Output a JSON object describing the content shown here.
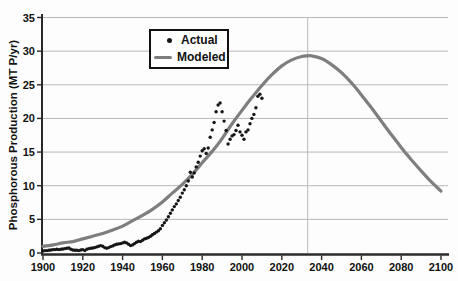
{
  "chart_data": {
    "type": "line",
    "title": "",
    "xlabel": "",
    "ylabel": "Phosphorous Production (MT P/yr)",
    "xlim": [
      1900,
      2100
    ],
    "ylim": [
      0,
      35
    ],
    "x_ticks": [
      1900,
      1920,
      1940,
      1960,
      1980,
      2000,
      2020,
      2040,
      2060,
      2080,
      2100
    ],
    "y_ticks": [
      0,
      5,
      10,
      15,
      20,
      25,
      30,
      35
    ],
    "grid": "horizontal gridlines every 5 units, single vertical gridline at peak year",
    "peak_line_year": 2033,
    "colors": {
      "actual": "#161616",
      "modeled": "#7e7e7e",
      "grid": "#b8b8b8",
      "axis": "#2a2a2a",
      "background": "#fdfdfd"
    },
    "legend": {
      "position": "top-center",
      "items": [
        {
          "label": "Actual",
          "marker": "dot"
        },
        {
          "label": "Modeled",
          "marker": "line"
        }
      ]
    },
    "series": [
      {
        "name": "Actual",
        "style": "scatter",
        "color": "#161616",
        "points": [
          [
            1900,
            0.3
          ],
          [
            1901,
            0.35
          ],
          [
            1902,
            0.35
          ],
          [
            1903,
            0.4
          ],
          [
            1904,
            0.45
          ],
          [
            1905,
            0.5
          ],
          [
            1906,
            0.5
          ],
          [
            1907,
            0.55
          ],
          [
            1908,
            0.5
          ],
          [
            1909,
            0.55
          ],
          [
            1910,
            0.6
          ],
          [
            1911,
            0.65
          ],
          [
            1912,
            0.7
          ],
          [
            1913,
            0.75
          ],
          [
            1914,
            0.55
          ],
          [
            1915,
            0.45
          ],
          [
            1916,
            0.4
          ],
          [
            1917,
            0.4
          ],
          [
            1918,
            0.35
          ],
          [
            1919,
            0.45
          ],
          [
            1920,
            0.5
          ],
          [
            1921,
            0.35
          ],
          [
            1922,
            0.55
          ],
          [
            1923,
            0.65
          ],
          [
            1924,
            0.7
          ],
          [
            1925,
            0.75
          ],
          [
            1926,
            0.8
          ],
          [
            1927,
            0.9
          ],
          [
            1928,
            1.0
          ],
          [
            1929,
            1.1
          ],
          [
            1930,
            1.0
          ],
          [
            1931,
            0.8
          ],
          [
            1932,
            0.7
          ],
          [
            1933,
            0.8
          ],
          [
            1934,
            0.95
          ],
          [
            1935,
            1.05
          ],
          [
            1936,
            1.2
          ],
          [
            1937,
            1.3
          ],
          [
            1938,
            1.35
          ],
          [
            1939,
            1.4
          ],
          [
            1940,
            1.5
          ],
          [
            1941,
            1.6
          ],
          [
            1942,
            1.5
          ],
          [
            1943,
            1.3
          ],
          [
            1944,
            1.1
          ],
          [
            1945,
            1.2
          ],
          [
            1946,
            1.4
          ],
          [
            1947,
            1.6
          ],
          [
            1948,
            1.75
          ],
          [
            1949,
            1.7
          ],
          [
            1950,
            1.9
          ],
          [
            1951,
            2.1
          ],
          [
            1952,
            2.2
          ],
          [
            1953,
            2.3
          ],
          [
            1954,
            2.5
          ],
          [
            1955,
            2.7
          ],
          [
            1956,
            2.9
          ],
          [
            1957,
            3.1
          ],
          [
            1958,
            3.3
          ],
          [
            1959,
            3.6
          ],
          [
            1960,
            4.1
          ],
          [
            1961,
            4.5
          ],
          [
            1962,
            4.9
          ],
          [
            1963,
            5.4
          ],
          [
            1964,
            5.9
          ],
          [
            1965,
            6.4
          ],
          [
            1966,
            6.9
          ],
          [
            1967,
            7.3
          ],
          [
            1968,
            7.8
          ],
          [
            1969,
            8.3
          ],
          [
            1970,
            8.9
          ],
          [
            1971,
            9.4
          ],
          [
            1972,
            10.0
          ],
          [
            1973,
            10.7
          ],
          [
            1974,
            12.0
          ],
          [
            1975,
            11.3
          ],
          [
            1976,
            11.9
          ],
          [
            1977,
            12.8
          ],
          [
            1978,
            13.5
          ],
          [
            1979,
            14.4
          ],
          [
            1980,
            15.2
          ],
          [
            1981,
            15.5
          ],
          [
            1982,
            14.8
          ],
          [
            1983,
            15.6
          ],
          [
            1984,
            17.2
          ],
          [
            1985,
            18.3
          ],
          [
            1986,
            19.4
          ],
          [
            1987,
            21.0
          ],
          [
            1988,
            22.0
          ],
          [
            1989,
            22.3
          ],
          [
            1990,
            21.0
          ],
          [
            1991,
            19.6
          ],
          [
            1992,
            18.2
          ],
          [
            1993,
            16.2
          ],
          [
            1994,
            16.9
          ],
          [
            1995,
            17.4
          ],
          [
            1996,
            17.6
          ],
          [
            1997,
            18.2
          ],
          [
            1998,
            19.0
          ],
          [
            1999,
            18.0
          ],
          [
            2000,
            17.5
          ],
          [
            2001,
            16.9
          ],
          [
            2002,
            18.0
          ],
          [
            2003,
            18.3
          ],
          [
            2004,
            19.2
          ],
          [
            2005,
            20.0
          ],
          [
            2006,
            20.6
          ],
          [
            2007,
            21.6
          ],
          [
            2008,
            23.3
          ],
          [
            2009,
            23.6
          ],
          [
            2010,
            23.0
          ]
        ]
      },
      {
        "name": "Modeled",
        "style": "line",
        "color": "#7e7e7e",
        "points": [
          [
            1900,
            1.0
          ],
          [
            1905,
            1.2
          ],
          [
            1910,
            1.5
          ],
          [
            1915,
            1.7
          ],
          [
            1920,
            2.1
          ],
          [
            1925,
            2.5
          ],
          [
            1930,
            2.9
          ],
          [
            1935,
            3.4
          ],
          [
            1940,
            4.0
          ],
          [
            1945,
            4.8
          ],
          [
            1950,
            5.6
          ],
          [
            1955,
            6.5
          ],
          [
            1960,
            7.6
          ],
          [
            1965,
            8.9
          ],
          [
            1970,
            10.2
          ],
          [
            1975,
            11.7
          ],
          [
            1980,
            13.4
          ],
          [
            1985,
            15.1
          ],
          [
            1990,
            17.0
          ],
          [
            1995,
            19.2
          ],
          [
            2000,
            21.2
          ],
          [
            2005,
            23.1
          ],
          [
            2010,
            24.9
          ],
          [
            2015,
            26.5
          ],
          [
            2020,
            27.8
          ],
          [
            2025,
            28.7
          ],
          [
            2030,
            29.2
          ],
          [
            2033,
            29.3
          ],
          [
            2035,
            29.3
          ],
          [
            2040,
            28.9
          ],
          [
            2045,
            28.0
          ],
          [
            2050,
            26.8
          ],
          [
            2055,
            25.3
          ],
          [
            2060,
            23.5
          ],
          [
            2065,
            21.6
          ],
          [
            2070,
            19.6
          ],
          [
            2075,
            17.6
          ],
          [
            2080,
            15.7
          ],
          [
            2085,
            13.9
          ],
          [
            2090,
            12.2
          ],
          [
            2095,
            10.6
          ],
          [
            2100,
            9.2
          ]
        ]
      }
    ]
  }
}
